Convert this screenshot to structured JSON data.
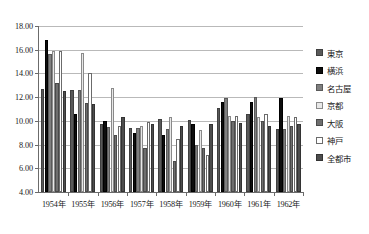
{
  "chart_data": {
    "type": "bar",
    "title": "",
    "xlabel": "",
    "ylabel": "",
    "ylim": [
      4.0,
      18.0
    ],
    "ytick_step": 2.0,
    "ytick_labels": [
      "18.00",
      "16.00",
      "14.00",
      "12.00",
      "10.00",
      "8.00",
      "6.00",
      "4.00"
    ],
    "ytick_values": [
      18.0,
      16.0,
      14.0,
      12.0,
      10.0,
      8.0,
      6.0,
      4.0
    ],
    "grid": true,
    "legend_position": "right",
    "categories": [
      "1954年",
      "1955年",
      "1956年",
      "1957年",
      "1958年",
      "1959年",
      "1960年",
      "1961年",
      "1962年"
    ],
    "series": [
      {
        "name": "東京",
        "color": "#595959",
        "border": "#3f3f3f",
        "values": [
          12.7,
          12.6,
          9.75,
          9.4,
          10.2,
          10.1,
          11.1,
          10.6,
          9.3
        ]
      },
      {
        "name": "横浜",
        "color": "#0d0d0d",
        "border": "#000000",
        "values": [
          16.8,
          10.6,
          10.0,
          9.0,
          8.8,
          9.7,
          11.6,
          11.6,
          11.9
        ]
      },
      {
        "name": "名古屋",
        "color": "#7f7f7f",
        "border": "#5a5a5a",
        "values": [
          15.6,
          12.6,
          9.5,
          9.4,
          9.3,
          8.0,
          11.9,
          12.0,
          9.3
        ]
      },
      {
        "name": "京都",
        "color": "#e8e8e8",
        "border": "#8a8a8a",
        "values": [
          15.9,
          15.7,
          12.8,
          9.6,
          10.3,
          9.2,
          10.4,
          10.3,
          10.4
        ]
      },
      {
        "name": "大阪",
        "color": "#6e6e6e",
        "border": "#4a4a4a",
        "values": [
          13.2,
          11.5,
          8.8,
          7.7,
          6.6,
          7.7,
          10.0,
          10.0,
          9.6
        ]
      },
      {
        "name": "神戸",
        "color": "#ffffff",
        "border": "#6b6b6b",
        "values": [
          15.9,
          14.0,
          9.6,
          9.9,
          8.5,
          7.1,
          10.4,
          10.6,
          10.3
        ]
      },
      {
        "name": "全都市",
        "color": "#4d4d4d",
        "border": "#333333",
        "values": [
          12.5,
          11.4,
          10.3,
          9.7,
          9.6,
          9.7,
          9.8,
          9.6,
          9.7
        ]
      }
    ]
  },
  "legend": {
    "items": [
      {
        "label": "東京"
      },
      {
        "label": "横浜"
      },
      {
        "label": "名古屋"
      },
      {
        "label": "京都"
      },
      {
        "label": "大阪"
      },
      {
        "label": "神戸"
      },
      {
        "label": "全都市"
      }
    ]
  }
}
